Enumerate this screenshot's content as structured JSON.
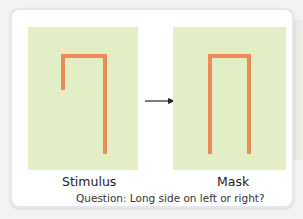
{
  "panels": {
    "stimulus": {
      "label": "Stimulus",
      "shape": "inverted-L (long side right)"
    },
    "mask": {
      "label": "Mask",
      "shape": "inverted-U (both sides long)"
    }
  },
  "question": "Question: Long side on left or right?",
  "colors": {
    "panel_background": "#e4efc6",
    "stroke": "#ef8a5a",
    "card_border": "#e3e6ea"
  },
  "icons": {
    "arrow": "right-arrow-icon"
  }
}
